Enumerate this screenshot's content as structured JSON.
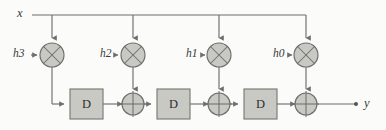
{
  "diagram": {
    "colors": {
      "background": "#fbfbf9",
      "stroke": "#6e6e6e",
      "block_fill": "#c9c9c4",
      "block_stroke": "#7a7a76",
      "label": "#3a3a3a"
    },
    "input": {
      "label": "x",
      "x": 19,
      "y": 8
    },
    "output": {
      "label": "y",
      "x": 366,
      "y": 97
    },
    "coefficients": [
      {
        "label": "h3",
        "x": 14,
        "y": 48,
        "node_x": 52,
        "node_y": 55
      },
      {
        "label": "h2",
        "x": 101,
        "y": 48,
        "node_x": 133,
        "node_y": 55
      },
      {
        "label": "h1",
        "x": 187,
        "y": 48,
        "node_x": 219,
        "node_y": 55
      },
      {
        "label": "h0",
        "x": 274,
        "y": 48,
        "node_x": 306,
        "node_y": 55
      }
    ],
    "delays": [
      {
        "label": "D",
        "x": 70,
        "y": 89,
        "w": 33,
        "h": 30
      },
      {
        "label": "D",
        "x": 157,
        "y": 89,
        "w": 33,
        "h": 30
      },
      {
        "label": "D",
        "x": 244,
        "y": 89,
        "w": 33,
        "h": 30
      }
    ],
    "adders": [
      {
        "symbol": "+",
        "cx": 133,
        "cy": 104,
        "r": 11
      },
      {
        "symbol": "+",
        "cx": 219,
        "cy": 104,
        "r": 11
      },
      {
        "symbol": "+",
        "cx": 306,
        "cy": 104,
        "r": 11
      }
    ],
    "multipliers": [
      {
        "symbol": "x",
        "cx": 52,
        "cy": 55,
        "r": 12
      },
      {
        "symbol": "x",
        "cx": 133,
        "cy": 55,
        "r": 12
      },
      {
        "symbol": "x",
        "cx": 219,
        "cy": 55,
        "r": 12
      },
      {
        "symbol": "x",
        "cx": 306,
        "cy": 55,
        "r": 12
      }
    ],
    "bus": {
      "y": 15,
      "x_start": 32,
      "x_end": 306
    }
  }
}
